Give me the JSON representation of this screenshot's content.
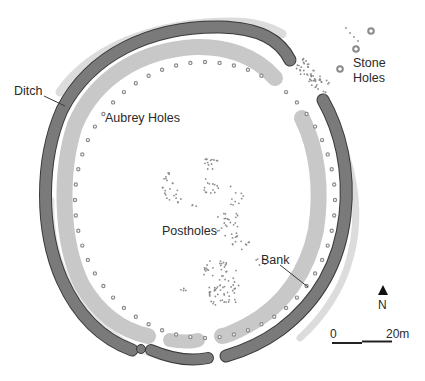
{
  "diagram": {
    "type": "site-plan",
    "colors": {
      "ditch_fill": "#7a7a7a",
      "ditch_stroke": "#3a3a3a",
      "bank_fill": "#c8c8c8",
      "outer_bank_fill": "#d9d9d9",
      "aubrey_hole": "#8a8a8a",
      "posthole": "#8c8c8c",
      "label_text": "#2a2a2a"
    },
    "labels": {
      "ditch": "Ditch",
      "aubrey_holes": "Aubrey Holes",
      "stone_holes": "Stone\nHoles",
      "postholes": "Postholes",
      "bank": "Bank"
    },
    "north_arrow": {
      "label": "N"
    },
    "scale_bar": {
      "start_label": "0",
      "end_label": "20m"
    }
  }
}
